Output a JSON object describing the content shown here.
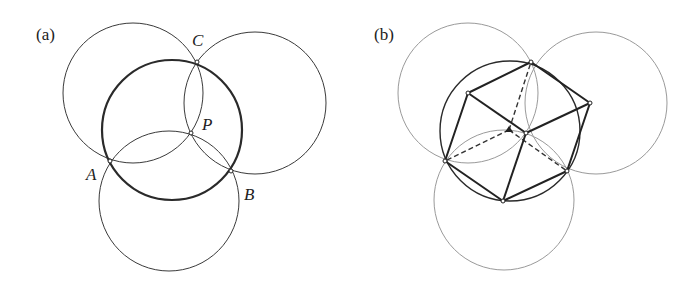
{
  "panels": [
    {
      "id": "a",
      "label": "(a)",
      "points": {
        "C": {
          "label": "C"
        },
        "P": {
          "label": "P"
        },
        "A": {
          "label": "A"
        },
        "B": {
          "label": "B"
        }
      },
      "description": "Three equal circles through common point P; their pairwise intersections A, B, C lie on a fourth circle of the same radius (bold)."
    },
    {
      "id": "b",
      "label": "(b)",
      "description": "Same configuration with the figure interpreted as a cube projection; hidden edges dashed."
    }
  ],
  "colors": {
    "bold_stroke": "#2a2a2a",
    "thin_stroke": "#3a3a3a",
    "light_stroke": "#9a9a9a",
    "background": "#ffffff"
  }
}
